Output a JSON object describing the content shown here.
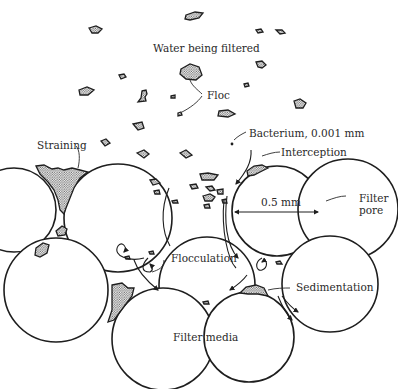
{
  "figure": {
    "type": "schematic",
    "colors": {
      "line": "#1e1e1e",
      "stipple_fill": "#9a9a9a",
      "background": "#ffffff"
    }
  },
  "labels": {
    "water": "Water being filtered",
    "floc": "Floc",
    "bacterium": "Bacterium, 0.001 mm",
    "interception": "Interception",
    "straining": "Straining",
    "grain_size": "0.5 mm",
    "filter_pore_line1": "Filter",
    "filter_pore_line2": "pore",
    "flocculation": "Flocculation",
    "sedimentation": "Sedimentation",
    "filter_media": "Filter media"
  },
  "grains": [
    {
      "id": "top-left",
      "cx": 118,
      "cy": 218,
      "r": 54
    },
    {
      "id": "top-right-measured",
      "cx": 277,
      "cy": 211,
      "r": 45
    },
    {
      "id": "far-right-partial",
      "cx": 348,
      "cy": 209,
      "r": 50
    },
    {
      "id": "center-flocculation",
      "cx": 207,
      "cy": 285,
      "r": 48
    },
    {
      "id": "lower-left",
      "cx": 56,
      "cy": 290,
      "r": 52
    },
    {
      "id": "bottom-filter-media",
      "cx": 163,
      "cy": 339,
      "r": 51
    },
    {
      "id": "bottom-right",
      "cx": 249,
      "cy": 337,
      "r": 45
    },
    {
      "id": "right-sedimentation",
      "cx": 330,
      "cy": 284,
      "r": 48
    },
    {
      "id": "far-left-partial",
      "cx": 14,
      "cy": 210,
      "r": 42
    }
  ],
  "mechanisms": [
    "Straining",
    "Interception",
    "Flocculation",
    "Sedimentation"
  ]
}
